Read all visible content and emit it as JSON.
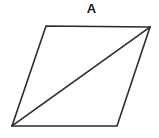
{
  "figure": {
    "label": "A",
    "shape_name": "parallelogram",
    "background_color": "#ffffff",
    "stroke_color": "#2b2b2b",
    "stroke_width": 1.6,
    "fill_color": "none",
    "canvas": {
      "width": 159,
      "height": 138
    },
    "vertices": {
      "top_left": {
        "x": 46,
        "y": 26
      },
      "top_right": {
        "x": 150,
        "y": 27
      },
      "bottom_right": {
        "x": 117,
        "y": 126
      },
      "bottom_left": {
        "x": 12,
        "y": 126
      }
    },
    "outline_points": "46,26 150,27 117,126 12,126",
    "diagonal": {
      "name": "diagonal-bottom-left-to-top-right",
      "x1": 12,
      "y1": 126,
      "x2": 150,
      "y2": 27
    },
    "label_position": {
      "x": 91,
      "y": 12
    }
  }
}
